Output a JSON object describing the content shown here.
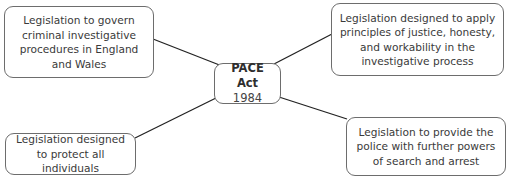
{
  "center": {
    "title": "PACE Act",
    "year": "1984"
  },
  "nodes": {
    "top_left": "Legislation to govern criminal investigative procedures in England and Wales",
    "top_right": "Legislation designed to apply principles of justice, honesty, and workability in the investigative process",
    "bottom_left": "Legislation designed to protect all individuals",
    "bottom_right": "Legislation to provide the police with further powers of search and arrest"
  },
  "colors": {
    "border": "#6d6d6d",
    "line": "#222222",
    "text": "#3a3a3a"
  }
}
